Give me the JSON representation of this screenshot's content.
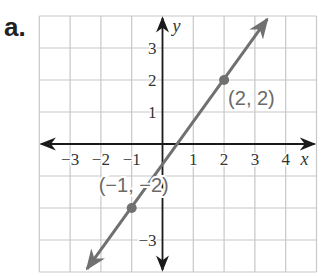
{
  "problem": {
    "label": "a."
  },
  "chart_data": {
    "type": "line",
    "title": "",
    "xlabel": "x",
    "ylabel": "y",
    "xlim": [
      -4,
      5
    ],
    "ylim": [
      -4,
      4
    ],
    "grid": true,
    "x_ticks": [
      -3,
      -2,
      -1,
      1,
      2,
      3,
      4
    ],
    "x_tick_labels": [
      "−3",
      "−2",
      "−1",
      "1",
      "2",
      "3",
      "4"
    ],
    "y_ticks": [
      3,
      2,
      1,
      -3
    ],
    "y_tick_labels": [
      "3",
      "2",
      "1",
      "−3"
    ],
    "series": [
      {
        "name": "line",
        "slope": 4,
        "note": "through (-1,-2) and (2,2); y = (4/3)x - 2/3",
        "endpoints": [
          [
            -2.45,
            -3.9
          ],
          [
            3.4,
            3.9
          ]
        ],
        "arrows": "both"
      }
    ],
    "points": [
      {
        "x": 2,
        "y": 2,
        "label": "(2, 2)"
      },
      {
        "x": -1,
        "y": -2,
        "label": "(−1, −2)"
      }
    ],
    "colors": {
      "line": "#707070",
      "grid": "#c8c8c8",
      "axis": "#1a1a1a"
    }
  }
}
